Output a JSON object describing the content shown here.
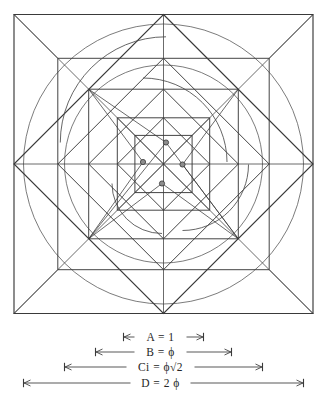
{
  "figure": {
    "background_color": "#ffffff",
    "line_color": "#3a3a3a",
    "faint_line_color": "#707070",
    "dot_fill_color": "#8d8d8d"
  },
  "dimensions": [
    {
      "id": "A",
      "name": "A",
      "equals": "=",
      "value": "1",
      "label": "A = 1",
      "half_extent": 40,
      "y": 337
    },
    {
      "id": "B",
      "name": "B",
      "equals": "=",
      "value": "ϕ",
      "label": "B = ϕ",
      "half_extent": 68,
      "y": 352
    },
    {
      "id": "Ci",
      "name": "Ci",
      "equals": "=",
      "value": "ϕ√2",
      "label": "Ci = ϕ√2",
      "half_extent": 99,
      "y": 367
    },
    {
      "id": "D",
      "name": "D",
      "equals": "=",
      "value": "2 ϕ",
      "label": "D = 2 ϕ",
      "half_extent": 140,
      "y": 383
    }
  ],
  "geometry": {
    "center": {
      "x": 163.5,
      "y": 164
    },
    "outer_square": {
      "x": 14,
      "y": 11,
      "size": 299
    },
    "squares": [
      {
        "name": "square-outer-D",
        "half": 149.5,
        "rotation": 0
      },
      {
        "name": "square-diamond-outer",
        "half": 149.5,
        "rotation": 45
      },
      {
        "name": "square-Ci",
        "half": 105.7,
        "rotation": 0
      },
      {
        "name": "square-diamond-Ci",
        "half": 105.7,
        "rotation": 45
      },
      {
        "name": "square-B",
        "half": 74.8,
        "rotation": 0
      },
      {
        "name": "square-diamond-B",
        "half": 74.8,
        "rotation": 45
      },
      {
        "name": "square-A",
        "half": 46.2,
        "rotation": 0
      },
      {
        "name": "square-diamond-A",
        "half": 46.2,
        "rotation": 45
      },
      {
        "name": "square-inner-core",
        "half": 28.6,
        "rotation": 0
      }
    ],
    "circles": [
      {
        "name": "circle-outer",
        "radius": 140
      },
      {
        "name": "circle-Ci",
        "radius": 99
      }
    ],
    "spiral_centers": [
      {
        "name": "spiral-center-top",
        "dx": 2.5,
        "dy": -21.5
      },
      {
        "name": "spiral-center-left",
        "dx": -20.5,
        "dy": -2.0
      },
      {
        "name": "spiral-center-right",
        "dx": 19.0,
        "dy": 0.5
      },
      {
        "name": "spiral-center-bottom",
        "dx": -1.5,
        "dy": 19.5
      }
    ]
  }
}
